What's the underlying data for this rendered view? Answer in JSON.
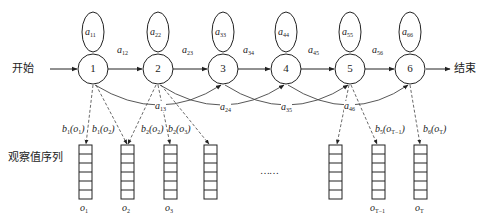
{
  "diagram": {
    "type": "hidden-markov-model",
    "start_label": "开始",
    "end_label": "结束",
    "observation_label": "观察值序列",
    "ellipsis": "……",
    "states": [
      {
        "id": "1",
        "x": 93,
        "self_loop": "a",
        "self_sub": "11"
      },
      {
        "id": "2",
        "x": 158,
        "self_loop": "a",
        "self_sub": "22"
      },
      {
        "id": "3",
        "x": 223,
        "self_loop": "a",
        "self_sub": "33"
      },
      {
        "id": "4",
        "x": 286,
        "self_loop": "a",
        "self_sub": "44"
      },
      {
        "id": "5",
        "x": 350,
        "self_loop": "a",
        "self_sub": "55"
      },
      {
        "id": "6",
        "x": 410,
        "self_loop": "a",
        "self_sub": "66"
      }
    ],
    "transitions": [
      {
        "from": "1",
        "to": "2",
        "label": "a",
        "sub": "12"
      },
      {
        "from": "2",
        "to": "3",
        "label": "a",
        "sub": "23"
      },
      {
        "from": "3",
        "to": "4",
        "label": "a",
        "sub": "34"
      },
      {
        "from": "4",
        "to": "5",
        "label": "a",
        "sub": "45"
      },
      {
        "from": "5",
        "to": "6",
        "label": "a",
        "sub": "56"
      }
    ],
    "skip_transitions": [
      {
        "from": "1",
        "to": "3",
        "label": "a",
        "sub": "13"
      },
      {
        "from": "2",
        "to": "4",
        "label": "a",
        "sub": "24"
      },
      {
        "from": "3",
        "to": "5",
        "label": "a",
        "sub": "35"
      },
      {
        "from": "4",
        "to": "6",
        "label": "a",
        "sub": "46"
      }
    ],
    "emissions": [
      {
        "state": "1",
        "func": "b",
        "fsub": "1",
        "obs": "o",
        "osub": "1"
      },
      {
        "state": "1",
        "func": "b",
        "fsub": "1",
        "obs": "o",
        "osub": "2"
      },
      {
        "state": "2",
        "func": "b",
        "fsub": "2",
        "obs": "o",
        "osub": "2"
      },
      {
        "state": "2",
        "func": "b",
        "fsub": "2",
        "obs": "o",
        "osub": "3"
      },
      {
        "state": "5",
        "func": "b",
        "fsub": "5",
        "obs": "o",
        "osub": "T−1"
      },
      {
        "state": "6",
        "func": "b",
        "fsub": "6",
        "obs": "o",
        "osub": "T"
      }
    ],
    "observations": [
      {
        "label": "o",
        "sub": "1"
      },
      {
        "label": "o",
        "sub": "2"
      },
      {
        "label": "o",
        "sub": "3"
      },
      {
        "label": "",
        "sub": ""
      },
      {
        "label": "",
        "sub": ""
      },
      {
        "label": "o",
        "sub": "T−1"
      },
      {
        "label": "o",
        "sub": "T"
      }
    ]
  }
}
